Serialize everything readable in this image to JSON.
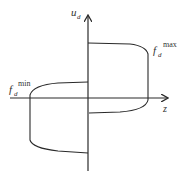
{
  "diagram": {
    "type": "hysteresis-loop",
    "axes": {
      "x_label": "z",
      "y_label_base": "u",
      "y_label_sub": "d"
    },
    "curves": [
      {
        "name": "f_d_max",
        "label_base": "f",
        "label_sub": "d",
        "label_sup": "max"
      },
      {
        "name": "f_d_min",
        "label_base": "f",
        "label_sub": "d",
        "label_sup": "min"
      }
    ],
    "colors": {
      "stroke": "#2a2a2a",
      "text": "#333333",
      "background": "#ffffff"
    }
  }
}
